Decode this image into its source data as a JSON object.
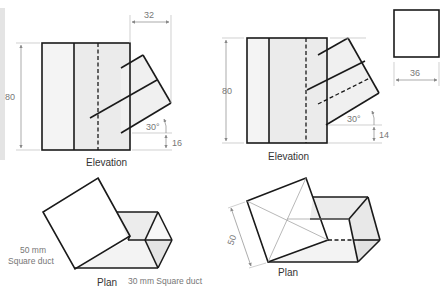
{
  "figure": {
    "colors": {
      "outline": "#1a1a1a",
      "fill_light": "#f3f3f3",
      "fill_mid": "#e6e6e6",
      "dimension": "#888888",
      "text": "#333333"
    },
    "left_elevation": {
      "label": "Elevation",
      "dim_height": "80",
      "dim_branch_width": "32",
      "angle": "30°",
      "dim_offset": "16"
    },
    "right_elevation": {
      "label": "Elevation",
      "dim_height": "80",
      "angle": "30°",
      "dim_offset": "14"
    },
    "square_view": {
      "dim_width": "36"
    },
    "left_plan": {
      "label": "Plan",
      "large_duct_label_line1": "50 mm",
      "large_duct_label_line2": "Square duct",
      "small_duct_label": "30 mm Square duct"
    },
    "right_plan": {
      "label": "Plan",
      "dim_side": "50"
    }
  }
}
